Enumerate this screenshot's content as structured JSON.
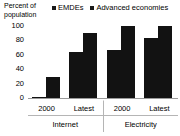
{
  "chart_data": {
    "type": "bar",
    "title": "",
    "subtitle": "",
    "ylabel": "Percent of population",
    "xlabel": "",
    "ylim": [
      0,
      100
    ],
    "yticks": [
      0,
      20,
      40,
      60,
      80,
      100
    ],
    "grid": false,
    "legend_position": "top",
    "categories": [
      "2000",
      "Latest",
      "2000",
      "Latest"
    ],
    "group_labels": [
      "Internet",
      "Electricity"
    ],
    "series": [
      {
        "name": "EMDEs",
        "color": "#121212",
        "values": [
          2,
          64,
          67,
          83
        ]
      },
      {
        "name": "Advanced economies",
        "color": "#121212",
        "values": [
          29,
          90,
          100,
          100
        ]
      }
    ],
    "groups": [
      {
        "label": "Internet",
        "clusters": [
          {
            "tick": "2000",
            "emdes": 2,
            "advanced": 29
          },
          {
            "tick": "Latest",
            "emdes": 64,
            "advanced": 90
          }
        ]
      },
      {
        "label": "Electricity",
        "clusters": [
          {
            "tick": "2000",
            "emdes": 67,
            "advanced": 100
          },
          {
            "tick": "Latest",
            "emdes": 83,
            "advanced": 100
          }
        ]
      }
    ]
  },
  "axis": {
    "y_title_line1": "Percent of",
    "y_title_line2": "population",
    "y_ticks": [
      "100",
      "80",
      "60",
      "40",
      "20",
      "0"
    ]
  },
  "legend": {
    "items": [
      {
        "label": "EMDEs"
      },
      {
        "label": "Advanced economies"
      }
    ]
  },
  "xaxis": {
    "ticks": [
      "2000",
      "Latest",
      "2000",
      "Latest"
    ],
    "groups": [
      "Internet",
      "Electricity"
    ]
  },
  "colors": {
    "bar": "#121212",
    "axis_line": "#9a9a9a",
    "text": "#000000",
    "background": "#ffffff"
  }
}
